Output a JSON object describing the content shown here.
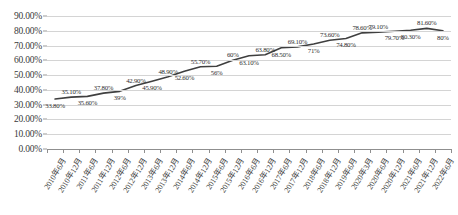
{
  "chart_data": {
    "type": "line",
    "title": "",
    "xlabel": "",
    "ylabel": "",
    "ylim": [
      0,
      90
    ],
    "ytick_step": 10,
    "grid": true,
    "legend": false,
    "series_color": "#3f3f3f",
    "categories": [
      "2010年6月",
      "2010年12月",
      "2011年6月",
      "2011年12月",
      "2012年6月",
      "2012年12月",
      "2013年6月",
      "2013年12月",
      "2014年6月",
      "2014年12月",
      "2015年6月",
      "2015年12月",
      "2016年6月",
      "2016年12月",
      "2017年6月",
      "2017年12月",
      "2018年6月",
      "2018年12月",
      "2019年6月",
      "2020年3月",
      "2020年6月",
      "2020年12月",
      "2021年6月",
      "2021年12月",
      "2022年6月"
    ],
    "values": [
      33.8,
      35.1,
      35.6,
      37.8,
      39.0,
      42.9,
      45.9,
      48.9,
      52.6,
      55.7,
      56.0,
      60.0,
      63.1,
      63.8,
      68.5,
      69.1,
      71.0,
      73.6,
      74.8,
      78.6,
      79.1,
      79.7,
      80.3,
      81.6,
      80.0
    ],
    "data_labels": [
      "33.80%",
      "35.10%",
      "35.60%",
      "37.80%",
      "39%",
      "42.90%",
      "45.90%",
      "48.90%",
      "52.60%",
      "55.70%",
      "56%",
      "60%",
      "63.10%",
      "63.80%",
      "68.50%",
      "69.10%",
      "71%",
      "73.60%",
      "74.80%",
      "78.60%",
      "79.10%",
      "79.70%",
      "80.30%",
      "81.60%",
      "80%"
    ],
    "label_positions": [
      "below",
      "above",
      "below",
      "above",
      "below",
      "above",
      "below",
      "above",
      "below",
      "above",
      "below",
      "above",
      "below",
      "above",
      "below",
      "above",
      "below",
      "above",
      "below",
      "above",
      "above",
      "below",
      "below",
      "above",
      "below"
    ],
    "ytick_labels": [
      "0.00%",
      "10.00%",
      "20.00%",
      "30.00%",
      "40.00%",
      "50.00%",
      "60.00%",
      "70.00%",
      "80.00%",
      "90.00%"
    ],
    "ytick_values": [
      0,
      10,
      20,
      30,
      40,
      50,
      60,
      70,
      80,
      90
    ]
  }
}
